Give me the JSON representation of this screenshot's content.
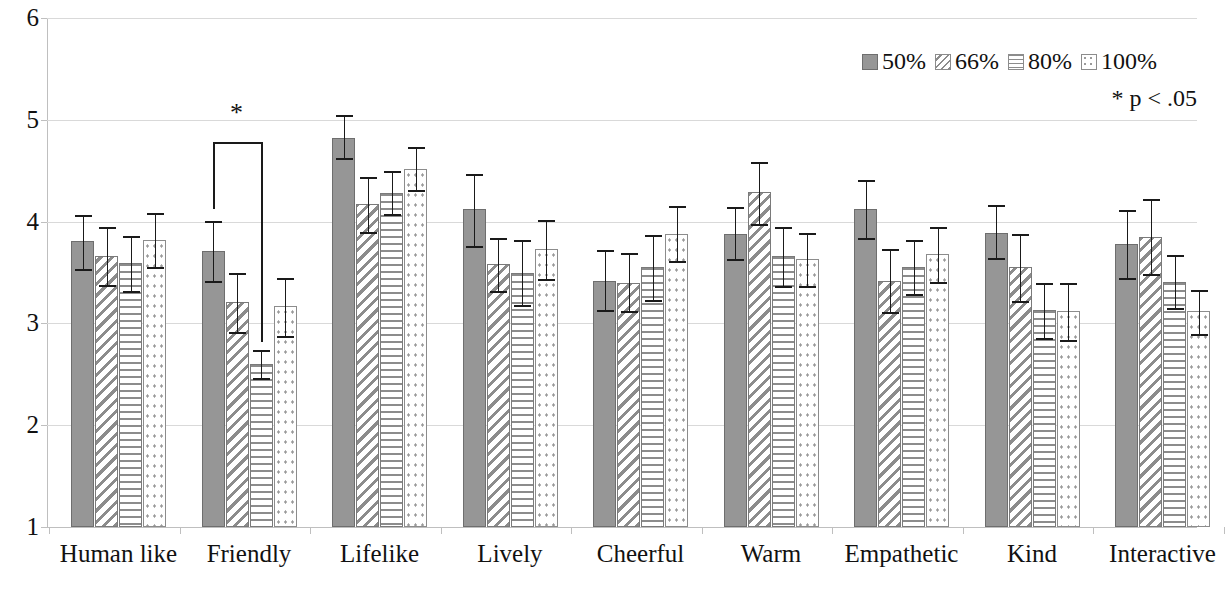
{
  "chart_data": {
    "type": "bar",
    "title": "",
    "xlabel": "",
    "ylabel": "",
    "ylim": [
      1,
      6
    ],
    "yticks": [
      1,
      2,
      3,
      4,
      5,
      6
    ],
    "grid": true,
    "legend_position": "top-right",
    "error_bars": "95% CI",
    "annotation": "* p < .05",
    "significance_markers": [
      {
        "category": "Friendly",
        "from_series": "50%",
        "to_series": "80%",
        "symbol": "*"
      }
    ],
    "categories": [
      "Human like",
      "Friendly",
      "Lifelike",
      "Lively",
      "Cheerful",
      "Warm",
      "Empathetic",
      "Kind",
      "Interactive"
    ],
    "series": [
      {
        "name": "50%",
        "values": [
          3.81,
          3.71,
          4.82,
          4.12,
          3.42,
          3.88,
          4.12,
          3.89,
          3.78
        ],
        "err_low": [
          3.53,
          3.42,
          4.62,
          3.76,
          3.13,
          3.63,
          3.84,
          3.64,
          3.45
        ],
        "err_high": [
          4.06,
          4.01,
          5.05,
          4.47,
          3.72,
          4.14,
          4.41,
          4.16,
          4.11
        ]
      },
      {
        "name": "66%",
        "values": [
          3.66,
          3.21,
          4.17,
          3.58,
          3.4,
          4.29,
          3.42,
          3.55,
          3.85
        ],
        "err_low": [
          3.38,
          2.92,
          3.9,
          3.32,
          3.12,
          3.98,
          3.11,
          3.22,
          3.49
        ],
        "err_high": [
          3.95,
          3.5,
          4.44,
          3.84,
          3.69,
          4.59,
          3.73,
          3.88,
          4.22
        ]
      },
      {
        "name": "80%",
        "values": [
          3.59,
          2.6,
          4.28,
          3.5,
          3.55,
          3.66,
          3.55,
          3.13,
          3.41
        ],
        "err_low": [
          3.32,
          2.46,
          4.07,
          3.18,
          3.23,
          3.37,
          3.29,
          2.86,
          3.15
        ],
        "err_high": [
          3.86,
          2.74,
          4.5,
          3.82,
          3.87,
          3.95,
          3.82,
          3.4,
          3.67
        ]
      },
      {
        "name": "100%",
        "values": [
          3.82,
          3.17,
          4.52,
          3.73,
          3.88,
          3.63,
          3.68,
          3.12,
          3.12
        ],
        "err_low": [
          3.55,
          2.88,
          4.31,
          3.44,
          3.61,
          3.37,
          3.41,
          2.84,
          2.9
        ],
        "err_high": [
          4.08,
          3.45,
          4.73,
          4.02,
          4.15,
          3.89,
          3.95,
          3.4,
          3.33
        ]
      }
    ]
  },
  "legend": {
    "items": [
      {
        "label": "50%",
        "pattern": "solid-gray"
      },
      {
        "label": "66%",
        "pattern": "diagonal-hatch"
      },
      {
        "label": "80%",
        "pattern": "horizontal-lines"
      },
      {
        "label": "100%",
        "pattern": "dotted"
      }
    ]
  },
  "footnote": "*  p < .05",
  "significance_symbol": "*",
  "axis": {
    "y_tick_labels": [
      "6",
      "5",
      "4",
      "3",
      "2",
      "1"
    ]
  }
}
